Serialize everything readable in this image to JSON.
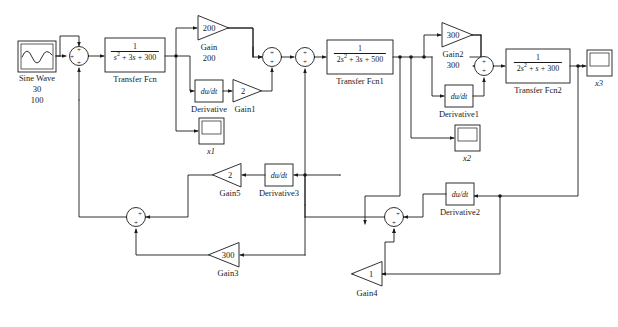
{
  "diagram": {
    "type": "control-system-block-diagram",
    "stroke_color": "#1a1a1a",
    "background": "#ffffff"
  },
  "source": {
    "name": "sine-wave",
    "label": "Sine Wave",
    "amplitude": "30",
    "frequency": "100"
  },
  "sum_blocks": [
    {
      "id": "sum1",
      "signs": [
        "+",
        "+",
        "+"
      ]
    },
    {
      "id": "sum2",
      "signs": [
        "+",
        "+"
      ]
    },
    {
      "id": "sum3",
      "signs": [
        "+",
        "+"
      ]
    },
    {
      "id": "sum4",
      "signs": [
        "+",
        "+"
      ]
    },
    {
      "id": "sum5",
      "signs": [
        "+",
        "+"
      ]
    },
    {
      "id": "sum6",
      "signs": [
        "+",
        "+"
      ]
    }
  ],
  "transfer_functions": [
    {
      "name": "transfer-fcn",
      "label": "Transfer Fcn",
      "numerator": "1",
      "denominator_terms": [
        "s",
        "2",
        " + 3",
        "s",
        " + 300"
      ],
      "denominator_text": "s2 + 3s + 300"
    },
    {
      "name": "transfer-fcn1",
      "label": "Transfer Fcn1",
      "numerator": "1",
      "denominator_text": "2s2 + 3s + 500"
    },
    {
      "name": "transfer-fcn2",
      "label": "Transfer Fcn2",
      "numerator": "1",
      "denominator_text": "2s2 + s + 300"
    }
  ],
  "gains": [
    {
      "name": "gain",
      "label": "Gain",
      "value": "200",
      "sub": "200",
      "dir": "right"
    },
    {
      "name": "gain1",
      "label": "Gain1",
      "value": "2",
      "sub": "",
      "dir": "right"
    },
    {
      "name": "gain2",
      "label": "Gain2",
      "value": "300",
      "sub": "300",
      "dir": "right"
    },
    {
      "name": "gain3",
      "label": "Gain3",
      "value": "300",
      "sub": "300",
      "dir": "left"
    },
    {
      "name": "gain4",
      "label": "Gain4",
      "value": "1",
      "sub": "",
      "dir": "left"
    },
    {
      "name": "gain5",
      "label": "Gain5",
      "value": "2",
      "sub": "",
      "dir": "left"
    }
  ],
  "derivatives": [
    {
      "name": "derivative",
      "label": "Derivative",
      "value": "du/dt"
    },
    {
      "name": "derivative1",
      "label": "Derivative1",
      "value": "du/dt"
    },
    {
      "name": "derivative2",
      "label": "Derivative2",
      "value": "du/dt"
    },
    {
      "name": "derivative3",
      "label": "Derivative3",
      "value": "du/dt"
    }
  ],
  "scopes": [
    {
      "name": "scope-x1",
      "label": "x1"
    },
    {
      "name": "scope-x2",
      "label": "x2"
    },
    {
      "name": "scope-x3",
      "label": "x3"
    }
  ]
}
